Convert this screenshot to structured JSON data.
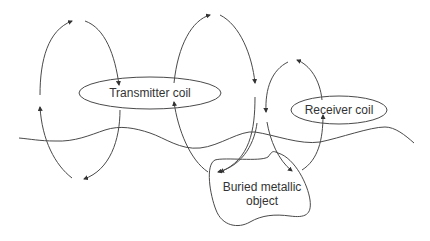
{
  "diagram": {
    "type": "metal-detector-field-diagram",
    "labels": {
      "transmitter": "Transmitter coil",
      "receiver": "Receiver coil",
      "object_line1": "Buried metallic",
      "object_line2": "object"
    },
    "colors": {
      "line": "#4a4a4a",
      "text": "#333333",
      "background": "#ffffff"
    }
  }
}
